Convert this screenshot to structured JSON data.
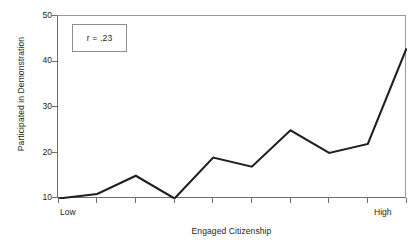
{
  "chart_data": {
    "type": "line",
    "title": "",
    "subtitle": "",
    "xlabel": "Engaged Citizenship",
    "ylabel": "Participated in Demonstration",
    "xlim": [
      0,
      9
    ],
    "ylim": [
      10,
      50
    ],
    "yticks": [
      50,
      40,
      30,
      20,
      10
    ],
    "ytick_labels": [
      "50",
      "40",
      "30",
      "20",
      "10"
    ],
    "xtick_count": 10,
    "x": [
      0,
      1,
      2,
      3,
      4,
      5,
      6,
      7,
      8,
      9
    ],
    "xtick_labels": [
      "Low",
      "",
      "",
      "",
      "",
      "",
      "",
      "",
      "",
      "High"
    ],
    "x_axis_endpoints": {
      "low": "Low",
      "high": "High"
    },
    "values": [
      10,
      11,
      15,
      10,
      19,
      17,
      25,
      20,
      22,
      43
    ],
    "series": [
      {
        "name": "Participated in Demonstration",
        "values": [
          10,
          11,
          15,
          10,
          19,
          17,
          25,
          20,
          22,
          43
        ],
        "color": "#231f20"
      }
    ],
    "grid": false,
    "legend": false,
    "legend_position": "none",
    "annotations": [
      {
        "text": "r = .23",
        "kind": "text-box",
        "x": 0.3,
        "y": 46
      }
    ],
    "colors": {
      "line": "#231f20",
      "axis": "#6d6d6d",
      "frame": "#9a9a9a",
      "annotation_border": "#8d8d8d",
      "text": "#231f20",
      "background": "#ffffff"
    }
  },
  "annotation_box": {
    "label": "r = .23"
  }
}
